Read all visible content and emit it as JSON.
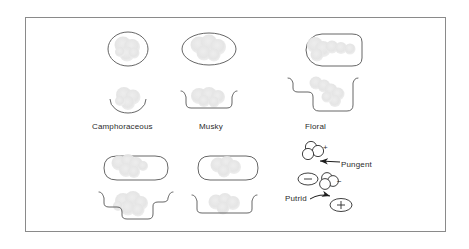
{
  "figure": {
    "background_color": "#ffffff",
    "frame_color": "#8a8a8a",
    "molecule_outline_color": "#555555",
    "molecule_fill_color": "#e6e6e6",
    "receptor_outline_color": "#555555",
    "text_color": "#2b2b2b"
  },
  "labels": {
    "camphoraceous": "Camphoraceous",
    "musky": "Musky",
    "floral": "Floral",
    "pungent": "Pungent",
    "putrid": "Putrid"
  },
  "signs": {
    "pungent_molecule_charge": "+",
    "pungent_site_charge": "−",
    "putrid_molecule_charge": "−",
    "putrid_site_charge": "+"
  },
  "columns": [
    {
      "id": "camphoraceous",
      "label": "Camphoraceous",
      "molecule_shape": "sphere",
      "receptor_shape": "hemispherical-bowl"
    },
    {
      "id": "musky",
      "label": "Musky",
      "molecule_shape": "wide-ellipse-disc",
      "receptor_shape": "shallow-flat-bottom-trough"
    },
    {
      "id": "floral",
      "label": "Floral",
      "molecule_shape": "disc-with-tail-keyhole",
      "receptor_shape": "deep-notched-trough"
    },
    {
      "id": "minty",
      "label": "",
      "molecule_shape": "wedge-stadium",
      "receptor_shape": "v-notched-trough"
    },
    {
      "id": "ethereal",
      "label": "",
      "molecule_shape": "rod-stadium",
      "receptor_shape": "narrow-flat-trough"
    }
  ],
  "charged_pairs": [
    {
      "id": "pungent",
      "label": "Pungent",
      "molecule": "cluster-of-three-circles",
      "molecule_charge": "+",
      "site": "ellipse",
      "site_charge": "−",
      "arrow": "straight-left"
    },
    {
      "id": "putrid",
      "label": "Putrid",
      "molecule": "cluster-of-three-circles",
      "molecule_charge": "−",
      "site": "ellipse",
      "site_charge": "+",
      "arrow": "curved-right"
    }
  ]
}
